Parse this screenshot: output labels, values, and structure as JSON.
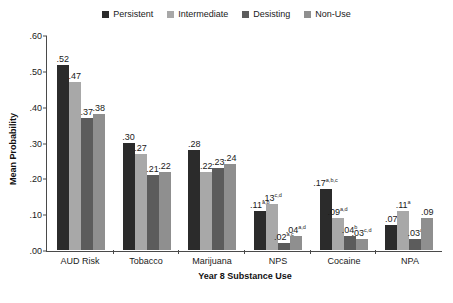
{
  "chart_data": {
    "type": "bar",
    "title": "",
    "xlabel": "Year 8 Substance Use",
    "ylabel": "Mean Probability",
    "ylim": [
      0,
      0.6
    ],
    "yticks": [
      ".00",
      ".10",
      ".20",
      ".30",
      ".40",
      ".50",
      ".60"
    ],
    "ytick_values": [
      0.0,
      0.1,
      0.2,
      0.3,
      0.4,
      0.5,
      0.6
    ],
    "grid": false,
    "legend_position": "top-center",
    "categories": [
      "AUD Risk",
      "Tobacco",
      "Marijuana",
      "NPS",
      "Cocaine",
      "NPA"
    ],
    "series": [
      {
        "name": "Persistent",
        "color": "#2b2b2b",
        "values": [
          0.52,
          0.3,
          0.28,
          0.11,
          0.17,
          0.07
        ],
        "labels": [
          ".52",
          ".30",
          ".28",
          ".11",
          ".17",
          ".07"
        ],
        "superscripts": [
          "",
          "",
          "",
          "a,b",
          "a,b,c",
          ""
        ]
      },
      {
        "name": "Intermediate",
        "color": "#a8a8a8",
        "values": [
          0.47,
          0.27,
          0.22,
          0.13,
          0.09,
          0.11
        ],
        "labels": [
          ".47",
          ".27",
          ".22",
          ".13",
          ".09",
          ".11"
        ],
        "superscripts": [
          "",
          "",
          "",
          "c,d",
          "a,d",
          "a"
        ]
      },
      {
        "name": "Desisting",
        "color": "#5c5c5c",
        "values": [
          0.37,
          0.21,
          0.23,
          0.02,
          0.04,
          0.03
        ],
        "labels": [
          ".37",
          ".21",
          ".23",
          ".02",
          ".04",
          ".03"
        ],
        "superscripts": [
          "",
          "",
          "",
          "a,c",
          "b",
          "a"
        ]
      },
      {
        "name": "Non-Use",
        "color": "#8f8f8f",
        "values": [
          0.38,
          0.22,
          0.24,
          0.04,
          0.03,
          0.09
        ],
        "labels": [
          ".38",
          ".22",
          ".24",
          ".04",
          ".03",
          ".09"
        ],
        "superscripts": [
          "",
          "",
          "",
          "a,d",
          "c,d",
          ""
        ]
      }
    ]
  }
}
